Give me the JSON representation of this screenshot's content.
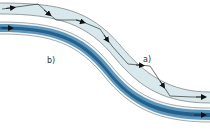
{
  "diagram": {
    "kind": "optical-fiber-propagation",
    "labels": {
      "a": "a)",
      "b": "b)"
    },
    "fibers": [
      {
        "id": "a",
        "description": "step-index fiber with zigzag ray (total internal reflection)",
        "fill": "#d8e8ec",
        "edge": "#7f8a8d",
        "ray_color": "#222222"
      },
      {
        "id": "b",
        "description": "graded-index fiber with gradient core",
        "core_color": "#1f5f8c",
        "mid_color": "#6fa3c4",
        "outer_color": "#dbe9f1",
        "edge": "#8a8a8a"
      }
    ],
    "colors": {
      "background": "#ffffff",
      "text": "#333333"
    }
  }
}
